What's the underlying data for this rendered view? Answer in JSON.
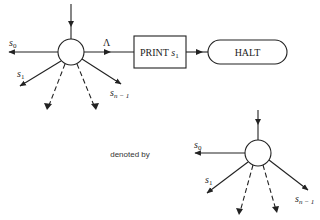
{
  "diagram": {
    "top": {
      "labels": {
        "s0": "s",
        "s0_sub": "0",
        "s1": "s",
        "s1_sub": "1",
        "sn": "s",
        "sn_sub": "n − 1",
        "lambda": "Λ"
      },
      "print_box": {
        "text": "PRINT ",
        "var": "s",
        "var_sub": "1"
      },
      "halt_box": {
        "text": "HALT"
      }
    },
    "caption": "denoted by",
    "bottom": {
      "labels": {
        "s0": "s",
        "s0_sub": "0",
        "s1": "s",
        "s1_sub": "1",
        "sn": "s",
        "sn_sub": "n − 1"
      }
    }
  }
}
